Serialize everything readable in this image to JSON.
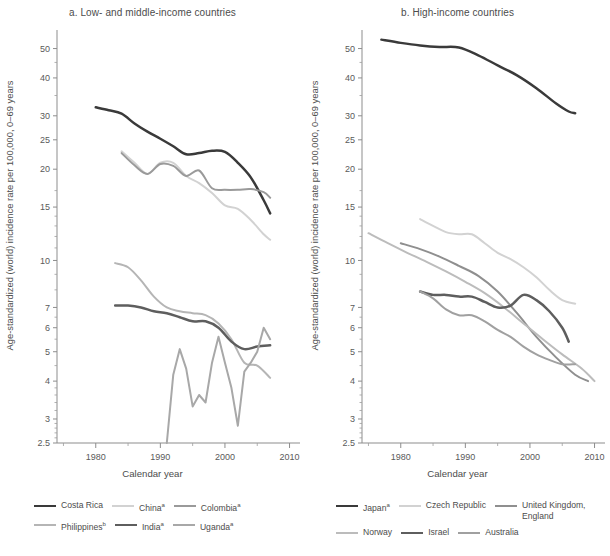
{
  "figure": {
    "xlabel": "Calendar year",
    "ylabel": "Age-standardized (world) incidence rate per 100,000, 0–69 years"
  },
  "panels": [
    {
      "id": "a",
      "title": "a. Low- and middle-income countries"
    },
    {
      "id": "b",
      "title": "b. High-income countries"
    }
  ],
  "legend_a": [
    {
      "label": "Costa Rica",
      "sup": "",
      "color": "#3a3a3a",
      "width": 2.4
    },
    {
      "label": "China",
      "sup": "a",
      "color": "#d2d2d2",
      "width": 2.2
    },
    {
      "label": "Colombia",
      "sup": "a",
      "color": "#9a9a9a",
      "width": 2.2
    },
    {
      "label": "Philippines",
      "sup": "b",
      "color": "#b5b5b5",
      "width": 2.2
    },
    {
      "label": "India",
      "sup": "a",
      "color": "#5e5e5e",
      "width": 2.6
    },
    {
      "label": "Uganda",
      "sup": "a",
      "color": "#a8a8a8",
      "width": 2.2
    }
  ],
  "legend_b": [
    {
      "label": "Japan",
      "sup": "a",
      "color": "#3a3a3a",
      "width": 2.6
    },
    {
      "label": "Czech Republic",
      "sup": "",
      "color": "#d2d2d2",
      "width": 2.2
    },
    {
      "label": "United Kingdom,\nEngland",
      "sup": "",
      "color": "#8f8f8f",
      "width": 2.2
    },
    {
      "label": "Norway",
      "sup": "",
      "color": "#bcbcbc",
      "width": 2.2
    },
    {
      "label": "Israel",
      "sup": "",
      "color": "#5e5e5e",
      "width": 2.6
    },
    {
      "label": "Australia",
      "sup": "",
      "color": "#a0a0a0",
      "width": 2.2
    }
  ],
  "chart_data": {
    "type": "line",
    "xlabel": "Calendar year",
    "ylabel": "Age-standardized (world) incidence rate per 100,000, 0–69 years",
    "yscale": "log",
    "ylim": [
      2.5,
      55
    ],
    "yticks": [
      2.5,
      3,
      4,
      5,
      6,
      7,
      10,
      15,
      20,
      25,
      30,
      40,
      50
    ],
    "ytick_labels": [
      "2.5",
      "3",
      "4",
      "5",
      "6",
      "7",
      "10",
      "15",
      "20",
      "25",
      "30",
      "40",
      "50"
    ],
    "xlim": [
      1974,
      2011
    ],
    "xticks": [
      1980,
      1990,
      2000,
      2010
    ],
    "xticks_minor": [
      1975,
      1985,
      1995,
      2005
    ],
    "grid": false,
    "legend_position": "below",
    "panels": [
      {
        "id": "a",
        "title": "a. Low- and middle-income countries",
        "series": [
          {
            "name": "Costa Rica",
            "color": "#3a3a3a",
            "x": [
              1980,
              1982,
              1984,
              1986,
              1988,
              1990,
              1992,
              1994,
              1996,
              1998,
              2000,
              2002,
              2004,
              2006,
              2007
            ],
            "y": [
              32.0,
              31.3,
              30.5,
              28.3,
              26.6,
              25.2,
              23.8,
              22.4,
              22.6,
              23.0,
              22.8,
              21.0,
              18.8,
              15.8,
              14.3
            ]
          },
          {
            "name": "China",
            "color": "#d2d2d2",
            "x": [
              1984,
              1986,
              1988,
              1990,
              1992,
              1994,
              1996,
              1998,
              2000,
              2002,
              2004,
              2006,
              2007
            ],
            "y": [
              22.9,
              21.0,
              19.3,
              21.0,
              21.0,
              19.0,
              18.0,
              16.7,
              15.2,
              14.8,
              13.6,
              12.2,
              11.7
            ]
          },
          {
            "name": "Colombia",
            "color": "#9a9a9a",
            "x": [
              1984,
              1986,
              1988,
              1990,
              1992,
              1994,
              1996,
              1998,
              2000,
              2002,
              2004,
              2006,
              2007
            ],
            "y": [
              22.6,
              20.6,
              19.3,
              20.8,
              20.5,
              19.0,
              19.8,
              17.3,
              17.1,
              17.1,
              17.2,
              16.8,
              16.1
            ]
          },
          {
            "name": "Philippines",
            "color": "#b5b5b5",
            "x": [
              1983,
              1985,
              1987,
              1989,
              1991,
              1993,
              1995,
              1997,
              1999,
              2001,
              2003,
              2005,
              2007
            ],
            "y": [
              9.8,
              9.5,
              8.6,
              7.6,
              7.0,
              6.8,
              6.7,
              6.6,
              6.2,
              5.5,
              4.6,
              4.5,
              4.1
            ]
          },
          {
            "name": "India",
            "color": "#5e5e5e",
            "x": [
              1983,
              1985,
              1987,
              1989,
              1991,
              1993,
              1995,
              1997,
              1999,
              2001,
              2003,
              2005,
              2007
            ],
            "y": [
              7.1,
              7.1,
              7.0,
              6.8,
              6.7,
              6.5,
              6.3,
              6.3,
              6.0,
              5.4,
              5.1,
              5.2,
              5.25
            ]
          },
          {
            "name": "Uganda",
            "color": "#a8a8a8",
            "x": [
              1991,
              1992,
              1993,
              1994,
              1995,
              1996,
              1997,
              1998,
              1999,
              2000,
              2001,
              2002,
              2003,
              2004,
              2005,
              2006,
              2007
            ],
            "y": [
              2.5,
              4.2,
              5.1,
              4.4,
              3.3,
              3.6,
              3.4,
              4.6,
              5.6,
              4.6,
              3.8,
              2.85,
              4.3,
              4.6,
              5.0,
              6.0,
              5.5
            ]
          }
        ]
      },
      {
        "id": "b",
        "title": "b. High-income countries",
        "series": [
          {
            "name": "Japan",
            "color": "#3a3a3a",
            "x": [
              1977,
              1980,
              1983,
              1986,
              1989,
              1992,
              1995,
              1998,
              2001,
              2004,
              2006,
              2007
            ],
            "y": [
              53.5,
              52.2,
              51.2,
              50.6,
              50.4,
              47.5,
              44.0,
              40.8,
              37.0,
              33.0,
              31.0,
              30.6
            ]
          },
          {
            "name": "Czech Republic",
            "color": "#d2d2d2",
            "x": [
              1983,
              1985,
              1987,
              1989,
              1991,
              1993,
              1995,
              1997,
              1999,
              2001,
              2003,
              2005,
              2007
            ],
            "y": [
              13.7,
              13.0,
              12.4,
              12.2,
              12.2,
              11.4,
              10.6,
              10.1,
              9.5,
              8.8,
              8.0,
              7.4,
              7.2
            ]
          },
          {
            "name": "United Kingdom, England",
            "color": "#8f8f8f",
            "x": [
              1980,
              1983,
              1986,
              1989,
              1992,
              1995,
              1998,
              2001,
              2004,
              2007,
              2009
            ],
            "y": [
              11.4,
              10.9,
              10.3,
              9.6,
              8.9,
              7.9,
              6.7,
              5.6,
              4.8,
              4.2,
              4.0
            ]
          },
          {
            "name": "Norway",
            "color": "#bcbcbc",
            "x": [
              1975,
              1978,
              1981,
              1984,
              1987,
              1990,
              1993,
              1996,
              1999,
              2002,
              2005,
              2008,
              2010
            ],
            "y": [
              12.3,
              11.4,
              10.6,
              9.9,
              9.2,
              8.5,
              7.8,
              7.0,
              6.2,
              5.5,
              4.9,
              4.4,
              4.0
            ]
          },
          {
            "name": "Israel",
            "color": "#5e5e5e",
            "x": [
              1983,
              1985,
              1987,
              1989,
              1991,
              1993,
              1995,
              1997,
              1999,
              2001,
              2003,
              2005,
              2006
            ],
            "y": [
              7.9,
              7.7,
              7.7,
              7.6,
              7.6,
              7.3,
              7.0,
              7.1,
              7.7,
              7.4,
              6.8,
              6.0,
              5.4
            ]
          },
          {
            "name": "Australia",
            "color": "#a0a0a0",
            "x": [
              1983,
              1985,
              1987,
              1989,
              1991,
              1993,
              1995,
              1997,
              1999,
              2001,
              2003,
              2005,
              2007
            ],
            "y": [
              7.9,
              7.5,
              6.9,
              6.6,
              6.6,
              6.3,
              5.9,
              5.6,
              5.2,
              4.9,
              4.7,
              4.55,
              4.55
            ]
          }
        ]
      }
    ]
  }
}
